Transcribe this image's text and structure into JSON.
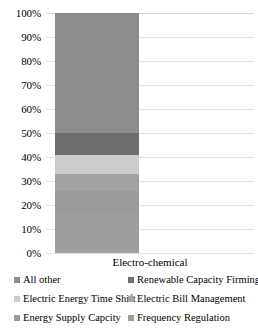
{
  "chart_data": {
    "type": "bar",
    "subtype": "stacked-100-percent",
    "title": "",
    "xlabel": "",
    "ylabel": "",
    "categories": [
      "Electro-chemical"
    ],
    "ylim": [
      0,
      100
    ],
    "ytick_labels": [
      "0%",
      "10%",
      "20%",
      "30%",
      "40%",
      "50%",
      "60%",
      "70%",
      "80%",
      "90%",
      "100%"
    ],
    "ytick_values": [
      0,
      10,
      20,
      30,
      40,
      50,
      60,
      70,
      80,
      90,
      100
    ],
    "grid": true,
    "grid_axis": "y",
    "legend_position": "bottom",
    "series": [
      {
        "name": "All other",
        "values": [
          50
        ],
        "color": "#8c8c8c",
        "stack_from": 50,
        "stack_to": 100
      },
      {
        "name": "Renewable Capacity Firming",
        "values": [
          9
        ],
        "color": "#6e6e6e",
        "stack_from": 41,
        "stack_to": 50
      },
      {
        "name": "Electric Energy Time Shift",
        "values": [
          8
        ],
        "color": "#cccccc",
        "stack_from": 33,
        "stack_to": 41
      },
      {
        "name": "Electric Bill Management",
        "values": [
          7
        ],
        "color": "#a3a3a3",
        "stack_from": 26,
        "stack_to": 33
      },
      {
        "name": "Energy Supply Capcity",
        "values": [
          9
        ],
        "color": "#9a9a9a",
        "stack_from": 17,
        "stack_to": 26
      },
      {
        "name": "Frequency Regulation",
        "values": [
          17
        ],
        "color": "#9e9e9e",
        "stack_from": 0,
        "stack_to": 17
      }
    ]
  },
  "axis": {
    "y_ticks": [
      {
        "label": "100%",
        "value": 100
      },
      {
        "label": "90%",
        "value": 90
      },
      {
        "label": "80%",
        "value": 80
      },
      {
        "label": "70%",
        "value": 70
      },
      {
        "label": "60%",
        "value": 60
      },
      {
        "label": "50%",
        "value": 50
      },
      {
        "label": "40%",
        "value": 40
      },
      {
        "label": "30%",
        "value": 30
      },
      {
        "label": "20%",
        "value": 20
      },
      {
        "label": "10%",
        "value": 10
      },
      {
        "label": "0%",
        "value": 0
      }
    ],
    "category_label": "Electro-chemical"
  },
  "legend": {
    "rows": [
      {
        "left": {
          "label": "All other",
          "color": "#8c8c8c"
        },
        "right": {
          "label": "Renewable Capacity Firming",
          "color": "#6e6e6e"
        }
      },
      {
        "left": {
          "label": "Electric Energy Time Shift",
          "color": "#cccccc"
        },
        "right": {
          "label": "Electric Bill Management",
          "color": "#a3a3a3"
        }
      },
      {
        "left": {
          "label": "Energy Supply Capcity",
          "color": "#9a9a9a"
        },
        "right": {
          "label": "Frequency Regulation",
          "color": "#9e9e9e"
        }
      }
    ]
  }
}
